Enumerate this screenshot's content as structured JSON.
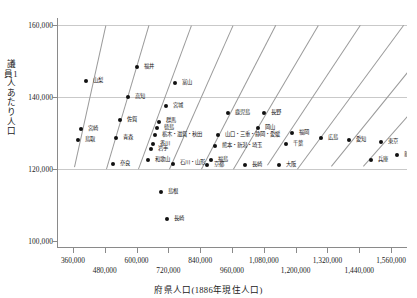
{
  "chart_data": {
    "type": "scatter",
    "title": "",
    "xlabel": "府県人口(1886年現住人口)",
    "ylabel": "議員1人あたり人口",
    "xlim": [
      300000,
      1620000
    ],
    "ylim": [
      98000,
      162000
    ],
    "xticks": [
      360000,
      480000,
      600000,
      720000,
      840000,
      960000,
      1080000,
      1200000,
      1320000,
      1440000,
      1560000
    ],
    "xtick_labels": [
      "360,000",
      "480,000",
      "600,000",
      "720,000",
      "840,000",
      "960,000",
      "1,080,000",
      "1,200,000",
      "1,320,000",
      "1,440,000",
      "1,560,000"
    ],
    "yticks": [
      100000,
      120000,
      140000,
      160000
    ],
    "ytick_labels": [
      "100,000",
      "120,000",
      "140,000",
      "160,000"
    ],
    "grid": true,
    "legend": "none",
    "series_note": "診断線は議員定数(整数)ごとの人口/定数の等値線",
    "seat_lines": [
      {
        "seats": 3,
        "x_start": 362000,
        "x_end": 480000
      },
      {
        "seats": 4,
        "x_start": 480000,
        "x_end": 640000
      },
      {
        "seats": 5,
        "x_start": 600000,
        "x_end": 800000
      },
      {
        "seats": 6,
        "x_start": 720000,
        "x_end": 960000
      },
      {
        "seats": 7,
        "x_start": 840000,
        "x_end": 1120000
      },
      {
        "seats": 8,
        "x_start": 960000,
        "x_end": 1280000
      },
      {
        "seats": 9,
        "x_start": 1090000,
        "x_end": 1440000
      },
      {
        "seats": 10,
        "x_start": 1200000,
        "x_end": 1600000
      },
      {
        "seats": 11,
        "x_start": 1330000,
        "x_end": 1620000
      },
      {
        "seats": 12,
        "x_start": 1450000,
        "x_end": 1620000
      }
    ],
    "points": [
      {
        "label": "山梨",
        "x": 404000,
        "y": 144500,
        "lx": 7,
        "ly": -3
      },
      {
        "label": "宮崎",
        "x": 385000,
        "y": 131000,
        "lx": 7,
        "ly": -3
      },
      {
        "label": "鳥取",
        "x": 376000,
        "y": 128000,
        "lx": 7,
        "ly": -3
      },
      {
        "label": "福井",
        "x": 597000,
        "y": 148500,
        "lx": 7,
        "ly": -3
      },
      {
        "label": "高知",
        "x": 563000,
        "y": 140000,
        "lx": 7,
        "ly": -3
      },
      {
        "label": "佐賀",
        "x": 535000,
        "y": 133500,
        "lx": 7,
        "ly": -3
      },
      {
        "label": "青森",
        "x": 520000,
        "y": 128500,
        "lx": 7,
        "ly": -3
      },
      {
        "label": "奈良",
        "x": 508000,
        "y": 121500,
        "lx": 7,
        "ly": -3
      },
      {
        "label": "富山",
        "x": 740000,
        "y": 144000,
        "lx": 7,
        "ly": -3
      },
      {
        "label": "宮城",
        "x": 706000,
        "y": 137500,
        "lx": 7,
        "ly": -3
      },
      {
        "label": "群馬",
        "x": 680000,
        "y": 133000,
        "lx": 7,
        "ly": -4
      },
      {
        "label": "徳島",
        "x": 673000,
        "y": 131500,
        "lx": 7,
        "ly": -3
      },
      {
        "label": "栃木・滋賀・秋田",
        "x": 666000,
        "y": 129500,
        "lx": 7,
        "ly": -3
      },
      {
        "label": "香川",
        "x": 657000,
        "y": 127000,
        "lx": 7,
        "ly": -3
      },
      {
        "label": "岩手",
        "x": 650000,
        "y": 125500,
        "lx": 7,
        "ly": -3
      },
      {
        "label": "和歌山",
        "x": 641000,
        "y": 122500,
        "lx": 7,
        "ly": -3
      },
      {
        "label": "石川・山形",
        "x": 735000,
        "y": 121500,
        "lx": 7,
        "ly": -4
      },
      {
        "label": "鹿児島",
        "x": 940000,
        "y": 135500,
        "lx": 7,
        "ly": -3
      },
      {
        "label": "山口・三重・静岡・愛媛",
        "x": 905000,
        "y": 129500,
        "lx": 7,
        "ly": -3
      },
      {
        "label": "熊本・新潟・埼玉",
        "x": 893000,
        "y": 126500,
        "lx": 7,
        "ly": -3
      },
      {
        "label": "福島",
        "x": 876000,
        "y": 122500,
        "lx": 7,
        "ly": -3
      },
      {
        "label": "京都",
        "x": 862000,
        "y": 121000,
        "lx": 7,
        "ly": -3
      },
      {
        "label": "長野",
        "x": 1078000,
        "y": 135500,
        "lx": 7,
        "ly": -3
      },
      {
        "label": "岡山",
        "x": 1053000,
        "y": 131500,
        "lx": 7,
        "ly": -3
      },
      {
        "label": "長崎",
        "x": 1005000,
        "y": 121000,
        "lx": 7,
        "ly": -3
      },
      {
        "label": "福岡",
        "x": 1184000,
        "y": 130000,
        "lx": 7,
        "ly": -3
      },
      {
        "label": "千葉",
        "x": 1160000,
        "y": 127000,
        "lx": 7,
        "ly": -3
      },
      {
        "label": "大阪",
        "x": 1132000,
        "y": 121000,
        "lx": 7,
        "ly": -3
      },
      {
        "label": "広島",
        "x": 1290000,
        "y": 128500,
        "lx": 7,
        "ly": -3
      },
      {
        "label": "愛知",
        "x": 1399000,
        "y": 128000,
        "lx": 7,
        "ly": -3
      },
      {
        "label": "東京",
        "x": 1520000,
        "y": 127500,
        "lx": 7,
        "ly": -3
      },
      {
        "label": "兵庫",
        "x": 1480000,
        "y": 122500,
        "lx": 7,
        "ly": -3
      },
      {
        "label": "新潟",
        "x": 1580000,
        "y": 124000,
        "lx": 7,
        "ly": -3
      },
      {
        "label": "島根",
        "x": 690000,
        "y": 113500,
        "lx": 7,
        "ly": -3
      },
      {
        "label": "長崎",
        "x": 712000,
        "y": 106000,
        "lx": 7,
        "ly": -3
      }
    ]
  }
}
